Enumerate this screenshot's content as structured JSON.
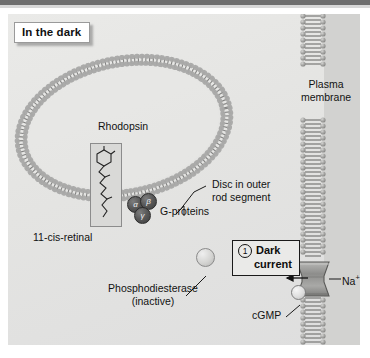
{
  "figure": {
    "title_chip": "In the dark",
    "background_color": "#e6e6e4"
  },
  "labels": {
    "rhodopsin": "Rhodopsin",
    "retinal": "11-",
    "retinal_italic": "cis",
    "retinal_tail": "-retinal",
    "g_proteins": "G-proteins",
    "g_alpha": "α",
    "g_beta": "β",
    "g_gamma": "γ",
    "disc_line1": "Disc in outer",
    "disc_line2": "rod segment",
    "plasma_line1": "Plasma",
    "plasma_line2": "membrane",
    "pde_line1": "Phosphodiesterase",
    "pde_line2": "(inactive)",
    "cgmp": "cGMP",
    "sodium": "Na",
    "sodium_sup": "+"
  },
  "callout": {
    "number": "1",
    "line1": "Dark",
    "line2": "current"
  },
  "colors": {
    "plate": "#e6e6e4",
    "membrane_head": "#9a9a9a",
    "membrane_tail": "#777777",
    "g_protein": "#585858",
    "channel": "#8f8f8f",
    "ink": "#121212"
  }
}
